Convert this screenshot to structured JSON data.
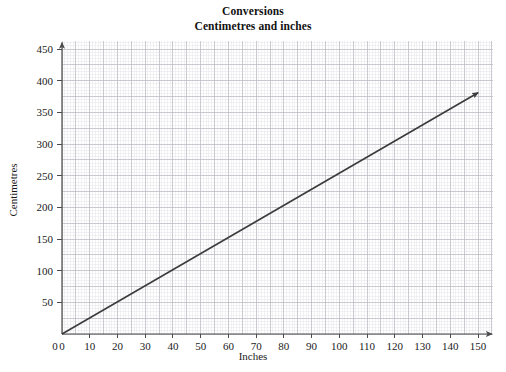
{
  "chart_data": {
    "type": "line",
    "title": "Conversions",
    "subtitle": "Centimetres and inches",
    "xlabel": "Inches",
    "ylabel": "Centimetres",
    "xlim": [
      0,
      155
    ],
    "ylim": [
      0,
      460
    ],
    "xticks": [
      0,
      10,
      20,
      30,
      40,
      50,
      60,
      70,
      80,
      90,
      100,
      110,
      120,
      130,
      140,
      150
    ],
    "yticks": [
      0,
      50,
      100,
      150,
      200,
      250,
      300,
      350,
      400,
      450
    ],
    "xtick_labels": [
      "0",
      "10",
      "20",
      "30",
      "40",
      "50",
      "60",
      "70",
      "80",
      "90",
      "100",
      "110",
      "120",
      "130",
      "140",
      "150"
    ],
    "ytick_labels": [
      "0",
      "50",
      "100",
      "150",
      "200",
      "250",
      "300",
      "350",
      "400",
      "450"
    ],
    "grid": true,
    "grid_major_step_x": 5,
    "grid_major_step_y": 25,
    "grid_minor_step_x": 1,
    "grid_minor_step_y": 5,
    "legend": null,
    "axis_arrows": true,
    "series": [
      {
        "name": "Centimetres per inch",
        "style": "straight-line-with-arrow",
        "color": "#3b3b3b",
        "slope_cm_per_inch": 2.54,
        "intercept": 0,
        "x": [
          0,
          150
        ],
        "values": [
          0,
          381
        ],
        "points": [
          {
            "inches": 0,
            "centimetres": 0
          },
          {
            "inches": 10,
            "centimetres": 25
          },
          {
            "inches": 20,
            "centimetres": 51
          },
          {
            "inches": 30,
            "centimetres": 76
          },
          {
            "inches": 40,
            "centimetres": 102
          },
          {
            "inches": 50,
            "centimetres": 127
          },
          {
            "inches": 60,
            "centimetres": 152
          },
          {
            "inches": 70,
            "centimetres": 178
          },
          {
            "inches": 80,
            "centimetres": 203
          },
          {
            "inches": 90,
            "centimetres": 229
          },
          {
            "inches": 100,
            "centimetres": 254
          },
          {
            "inches": 110,
            "centimetres": 279
          },
          {
            "inches": 120,
            "centimetres": 305
          },
          {
            "inches": 130,
            "centimetres": 330
          },
          {
            "inches": 140,
            "centimetres": 356
          },
          {
            "inches": 150,
            "centimetres": 381
          }
        ]
      }
    ],
    "colors": {
      "line": "#3b3b3b",
      "axis": "#4a4a4a",
      "grid_major": "#b9b9c2",
      "grid_minor": "#e6e6ec",
      "text": "#1a1a1a",
      "background": "#ffffff"
    }
  }
}
